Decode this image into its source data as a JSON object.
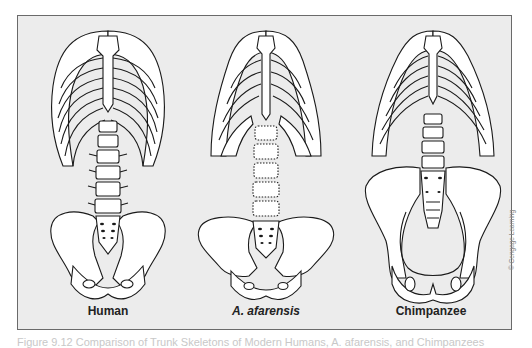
{
  "figure": {
    "panels": [
      {
        "id": "human",
        "label": "Human",
        "italic": false
      },
      {
        "id": "afarensis",
        "label": "A. afarensis",
        "italic": true
      },
      {
        "id": "chimpanzee",
        "label": "Chimpanzee",
        "italic": false
      }
    ],
    "credit": "© Cengage Learning",
    "caption": "Figure 9.12  Comparison of Trunk Skeletons of Modern Humans, A. afarensis, and Chimpanzees",
    "colors": {
      "panel_background": "#ececec",
      "panel_border": "#6a6a6a",
      "line_art": "#1a1a1a",
      "bone_fill": "#ffffff",
      "label_text": "#222222",
      "credit_text": "#888888"
    }
  }
}
